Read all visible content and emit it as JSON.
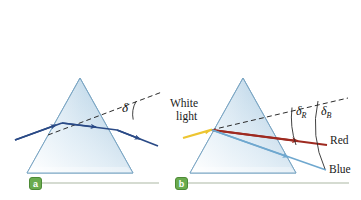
{
  "figure": {
    "background_color": "#ffffff"
  },
  "panels": [
    {
      "id": "a",
      "badge_label": "a",
      "badge_color": "#6aab4e",
      "caption": "Single ray of light deviated by angle delta",
      "prism": {
        "apex_x": 80,
        "apex_y": 78,
        "left_x": 27,
        "right_x": 133,
        "base_y": 173,
        "fill_light": "#eaf2f8",
        "fill_mid": "#bed7e8",
        "stroke": "#7ba6c4"
      },
      "rays": [
        {
          "name": "incident-ray",
          "color": "#2a4a86",
          "label": ""
        },
        {
          "name": "internal-ray",
          "color": "#2a4a86",
          "label": ""
        },
        {
          "name": "emergent-ray",
          "color": "#2a4a86",
          "label": ""
        }
      ],
      "dashed_line": {
        "name": "extension-line",
        "color": "#2b2b2b",
        "style": "dashed"
      },
      "angles": [
        {
          "name": "deviation-angle",
          "symbol": "δ",
          "subscript": ""
        }
      ]
    },
    {
      "id": "b",
      "badge_label": "b",
      "badge_color": "#6aab4e",
      "caption": "White light dispersed into red and blue by a prism",
      "prism": {
        "apex_x": 243,
        "apex_y": 78,
        "left_x": 190,
        "right_x": 296,
        "base_y": 173,
        "fill_light": "#eaf2f8",
        "fill_mid": "#bed7e8",
        "stroke": "#7ba6c4"
      },
      "rays": [
        {
          "name": "white-light-ray",
          "color": "#edc531",
          "label_line1": "White",
          "label_line2": "light"
        },
        {
          "name": "red-ray",
          "color": "#9e2a20",
          "label": "Red"
        },
        {
          "name": "blue-ray",
          "color": "#6fa8cf",
          "label": "Blue"
        }
      ],
      "dashed_line": {
        "name": "extension-line",
        "color": "#2b2b2b",
        "style": "dashed"
      },
      "angles": [
        {
          "name": "red-deviation-angle",
          "symbol": "δ",
          "subscript": "R"
        },
        {
          "name": "blue-deviation-angle",
          "symbol": "δ",
          "subscript": "B"
        }
      ]
    }
  ],
  "labels": {
    "white_light_line1": "White",
    "white_light_line2": "light",
    "red": "Red",
    "blue": "Blue",
    "delta": "δ",
    "subscript_r": "R",
    "subscript_b": "B",
    "badge_a": "a",
    "badge_b": "b"
  },
  "colors": {
    "prism_light": "#eef5fa",
    "prism_mid": "#bed7e8",
    "prism_edge": "#7ba6c4",
    "ray_dark_blue": "#2a4a86",
    "ray_yellow": "#edc531",
    "ray_red": "#9e2a20",
    "ray_blue": "#6fa8cf",
    "dashed": "#2b2b2b",
    "badge_green": "#6aab4e",
    "baseline_gray": "#d8ddd4"
  }
}
